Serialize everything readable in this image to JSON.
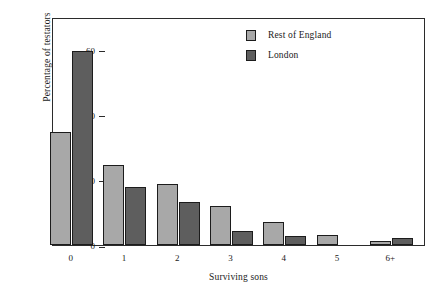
{
  "chart_data": {
    "type": "bar",
    "title": "",
    "subtitle": "",
    "xlabel": "Surviving sons",
    "ylabel": "Percentage of testators",
    "categories": [
      "0",
      "1",
      "2",
      "3",
      "4",
      "5",
      "6+"
    ],
    "series": [
      {
        "name": "Rest of England",
        "color": "#a8a8a8",
        "values": [
          34.7,
          24.5,
          18.7,
          12.1,
          7.2,
          3.0,
          1.2
        ]
      },
      {
        "name": "London",
        "color": "#5e5e5e",
        "values": [
          59.7,
          17.8,
          13.3,
          4.3,
          2.7,
          0,
          2.2
        ]
      }
    ],
    "ylim": [
      0,
      70
    ],
    "yticks": [
      0,
      20,
      40,
      60
    ],
    "ytick_labels": [
      "0",
      "20",
      "40",
      "60"
    ],
    "grid": false,
    "legend_position": "top-right",
    "frame": true,
    "annotations": []
  },
  "legend": {
    "entries": [
      {
        "label": "Rest of England"
      },
      {
        "label": "London"
      }
    ]
  },
  "axes": {
    "y_label": "Percentage of testators",
    "x_label": "Surviving sons"
  }
}
